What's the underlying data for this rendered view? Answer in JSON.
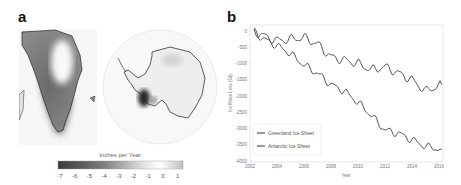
{
  "panels": {
    "a": {
      "label": "a",
      "colorbar": {
        "title": "Inches per Year",
        "ticks": [
          "-7",
          "-6",
          "-5",
          "-4",
          "-3",
          "-2",
          "-1",
          "0",
          "1"
        ],
        "range": [
          -7,
          1.5
        ],
        "colormap": [
          "#3a3a3a",
          "#ffffff",
          "#bdbdbd"
        ]
      },
      "maps": [
        "Greenland",
        "Antarctica"
      ]
    },
    "b": {
      "label": "b"
    }
  },
  "chart_data": [
    {
      "type": "heatmap",
      "title": "",
      "description": "Maps of ice mass change rate over Greenland and Antarctica",
      "colorbar_label": "Inches per Year",
      "colorbar_ticks": [
        -7,
        -6,
        -5,
        -4,
        -3,
        -2,
        -1,
        0,
        1
      ],
      "regions": [
        "Greenland",
        "Antarctica"
      ]
    },
    {
      "type": "line",
      "title": "",
      "xlabel": "Year",
      "ylabel": "Ice Mass Loss (Gt)",
      "xlim": [
        2002,
        2016.3
      ],
      "ylim": [
        -4000,
        0
      ],
      "xticks": [
        2002,
        2004,
        2006,
        2008,
        2010,
        2012,
        2014,
        2016
      ],
      "yticks": [
        0,
        -500,
        -1000,
        -1500,
        -2000,
        -2500,
        -3000,
        -3500,
        -4000
      ],
      "grid": false,
      "legend_position": "lower left",
      "x": [
        2002.3,
        2003,
        2004,
        2005,
        2006,
        2007,
        2008,
        2009,
        2010,
        2011,
        2012,
        2013,
        2014,
        2015,
        2016.2
      ],
      "series": [
        {
          "name": "Greenland Ice Sheet",
          "values": [
            0,
            -250,
            -450,
            -700,
            -1050,
            -1300,
            -1650,
            -1850,
            -2200,
            -2600,
            -3050,
            -3150,
            -3350,
            -3550,
            -3650
          ]
        },
        {
          "name": "Antarctic Ice Sheet",
          "values": [
            0,
            -150,
            -300,
            -250,
            -200,
            -400,
            -800,
            -900,
            -1000,
            -1200,
            -1100,
            -1300,
            -1500,
            -1850,
            -1650
          ]
        }
      ]
    }
  ]
}
